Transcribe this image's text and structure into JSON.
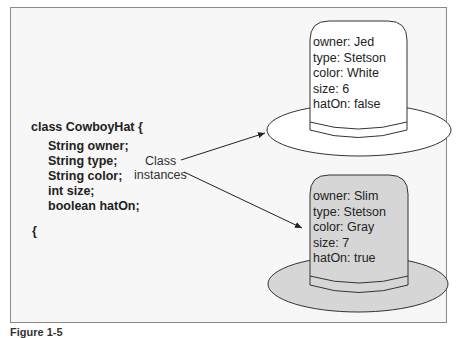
{
  "class_def": {
    "header": "class CowboyHat {",
    "fields": [
      "String owner;",
      "String type;",
      "String color;",
      "int size;",
      "boolean hatOn;"
    ],
    "closing": "{"
  },
  "annotation": {
    "line1": "Class",
    "line2": "instances"
  },
  "instances": [
    {
      "owner": "owner: Jed",
      "type": "type: Stetson",
      "color": "color: White",
      "size": "size: 6",
      "hatOn": "hatOn: false",
      "fill": "#ffffff"
    },
    {
      "owner": "owner: Slim",
      "type": "type: Stetson",
      "color": "color: Gray",
      "size": "size: 7",
      "hatOn": "hatOn: true",
      "fill": "#d6d6d6"
    }
  ],
  "caption": "Figure 1-5"
}
